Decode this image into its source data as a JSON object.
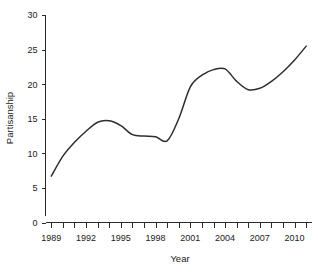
{
  "chart_data": {
    "type": "line",
    "title": "",
    "subtitle": "",
    "xlabel": "Year",
    "ylabel": "Partisanship",
    "xlim": [
      1988.5,
      2011.5
    ],
    "ylim": [
      0,
      30
    ],
    "grid": false,
    "legend": null,
    "x_tick_labels": [
      "1989",
      "1992",
      "1995",
      "1998",
      "2001",
      "2004",
      "2007",
      "2010"
    ],
    "x_tick_label_values": [
      1989,
      1992,
      1995,
      1998,
      2001,
      2004,
      2007,
      2010
    ],
    "x_minor_ticks": [
      1989,
      1990,
      1991,
      1992,
      1993,
      1994,
      1995,
      1996,
      1997,
      1998,
      1999,
      2000,
      2001,
      2002,
      2003,
      2004,
      2005,
      2006,
      2007,
      2008,
      2009,
      2010,
      2011
    ],
    "y_tick_labels": [
      "0",
      "5",
      "10",
      "15",
      "20",
      "25",
      "30"
    ],
    "y_tick_values": [
      0,
      5,
      10,
      15,
      20,
      25,
      30
    ],
    "line_color": "#2e2e2e",
    "axis_color": "#2b2b2b",
    "background_color": "#ffffff",
    "x": [
      1989,
      1990,
      1991,
      1992,
      1993,
      1994,
      1995,
      1996,
      1997,
      1998,
      1999,
      2000,
      2001,
      2002,
      2003,
      2004,
      2005,
      2006,
      2007,
      2008,
      2009,
      2010,
      2011
    ],
    "series": [
      {
        "name": "Partisanship",
        "values": [
          6.7,
          9.6,
          11.6,
          13.2,
          14.5,
          14.7,
          14.0,
          12.7,
          12.5,
          12.4,
          11.8,
          15.0,
          19.6,
          21.3,
          22.1,
          22.2,
          20.4,
          19.2,
          19.4,
          20.4,
          21.8,
          23.5,
          25.5
        ]
      }
    ]
  }
}
